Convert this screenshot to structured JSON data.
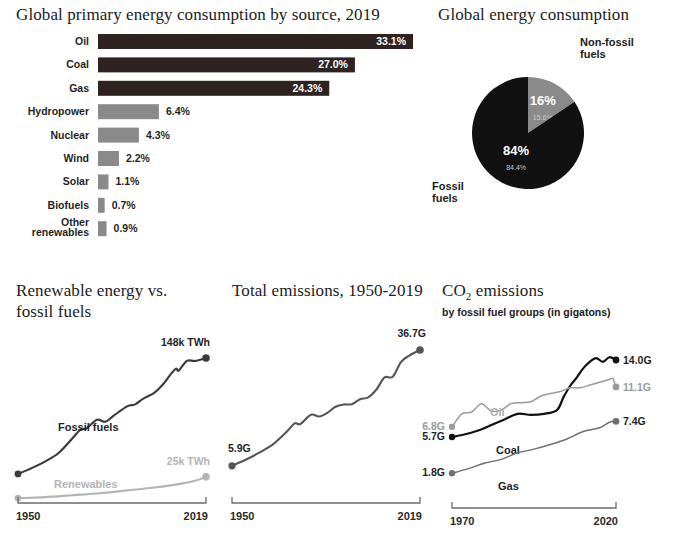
{
  "bar_panel": {
    "title": "Global primary energy consumption by source, 2019"
  },
  "pie_panel": {
    "title": "Global energy consumption",
    "label_nonfossil_line1": "Non-fossil",
    "label_nonfossil_line2": "fuels",
    "label_fossil_line1": "Fossil",
    "label_fossil_line2": "fuels"
  },
  "renew_panel": {
    "title_line1": "Renewable energy vs.",
    "title_line2": "fossil fuels"
  },
  "emis_panel": {
    "title": "Total emissions, 1950-2019"
  },
  "co2_panel": {
    "title_main": "CO",
    "title_sub": "2",
    "title_rest": " emissions",
    "subtitle": "by fossil fuel groups (in gigatons)"
  },
  "colors": {
    "dark": "#2e2320",
    "near_black": "#111111",
    "mid_gray": "#8a8a8a",
    "light_gray": "#b4b4b4",
    "line_dark": "#3a3a3a",
    "axis": "#6b6b6b",
    "white": "#ffffff"
  },
  "chart_data": [
    {
      "id": "energy-by-source",
      "type": "bar",
      "orientation": "horizontal",
      "title": "Global primary energy consumption by source, 2019",
      "xlabel": "",
      "ylabel": "",
      "unit": "%",
      "xlim": [
        0,
        33.1
      ],
      "grid": false,
      "categories": [
        "Oil",
        "Coal",
        "Gas",
        "Hydropower",
        "Nuclear",
        "Wind",
        "Solar",
        "Biofuels",
        "Other renewables"
      ],
      "values": [
        33.1,
        27.0,
        24.3,
        6.4,
        4.3,
        2.2,
        1.1,
        0.7,
        0.9
      ],
      "value_labels": [
        "33.1%",
        "27.0%",
        "24.3%",
        "6.4%",
        "4.3%",
        "2.2%",
        "1.1%",
        "0.7%",
        "0.9%"
      ],
      "label_inside": [
        true,
        true,
        true,
        false,
        false,
        false,
        false,
        false,
        false
      ],
      "bar_colors": [
        "#2e2320",
        "#2e2320",
        "#2e2320",
        "#8a8a8a",
        "#8a8a8a",
        "#8a8a8a",
        "#8a8a8a",
        "#8a8a8a",
        "#8a8a8a"
      ]
    },
    {
      "id": "global-energy-consumption",
      "type": "pie",
      "title": "Global energy consumption",
      "legend_position": "outside",
      "slices": [
        {
          "label": "Non-fossil fuels",
          "value": 15.6,
          "rounded_label": "16%",
          "exact_label": "15.6%",
          "color": "#8a8a8a"
        },
        {
          "label": "Fossil fuels",
          "value": 84.4,
          "rounded_label": "84%",
          "exact_label": "84.4%",
          "color": "#111111"
        }
      ]
    },
    {
      "id": "renewables-vs-fossil",
      "type": "line",
      "title": "Renewable energy vs. fossil fuels",
      "xlabel": "",
      "ylabel": "",
      "unit": "TWh",
      "xlim": [
        1950,
        2019
      ],
      "ylim": [
        0,
        148
      ],
      "x_ticks": [
        "1950",
        "2019"
      ],
      "grid": false,
      "series": [
        {
          "name": "Fossil fuels",
          "color": "#3a3a3a",
          "start_label": "",
          "end_label": "148k TWh",
          "x": [
            1950,
            1955,
            1960,
            1965,
            1970,
            1973,
            1975,
            1979,
            1982,
            1985,
            1990,
            1993,
            1996,
            2000,
            2003,
            2006,
            2008,
            2009,
            2012,
            2015,
            2019
          ],
          "values": [
            28,
            34,
            41,
            50,
            65,
            74,
            75,
            84,
            82,
            88,
            98,
            100,
            106,
            112,
            120,
            131,
            137,
            135,
            145,
            145,
            148
          ]
        },
        {
          "name": "Renewables",
          "color": "#b4b4b4",
          "start_label": "",
          "end_label": "25k TWh",
          "x": [
            1950,
            1960,
            1970,
            1980,
            1990,
            2000,
            2010,
            2015,
            2019
          ],
          "values": [
            3,
            4,
            6,
            8,
            11,
            14,
            18,
            21,
            25
          ]
        }
      ]
    },
    {
      "id": "total-emissions",
      "type": "line",
      "title": "Total emissions, 1950-2019",
      "xlabel": "",
      "ylabel": "",
      "unit": "G",
      "xlim": [
        1950,
        2019
      ],
      "ylim": [
        0,
        36.7
      ],
      "x_ticks": [
        "1950",
        "2019"
      ],
      "grid": false,
      "series": [
        {
          "name": "Total emissions",
          "color": "#555555",
          "start_label": "5.9G",
          "end_label": "36.7G",
          "x": [
            1950,
            1955,
            1960,
            1965,
            1970,
            1973,
            1975,
            1979,
            1982,
            1985,
            1988,
            1991,
            1994,
            1997,
            2000,
            2003,
            2006,
            2009,
            2012,
            2015,
            2019
          ],
          "values": [
            5.9,
            7.5,
            9.4,
            11.6,
            14.9,
            17.2,
            17.0,
            19.5,
            19.0,
            20.0,
            21.6,
            22.2,
            22.3,
            23.6,
            24.1,
            26.2,
            29.4,
            29.6,
            33.5,
            35.2,
            36.7
          ]
        }
      ]
    },
    {
      "id": "co2-by-fossil-group",
      "type": "line",
      "title": "CO2 emissions",
      "subtitle": "by fossil fuel groups (in gigatons)",
      "xlabel": "",
      "ylabel": "",
      "unit": "G",
      "xlim": [
        1970,
        2020
      ],
      "ylim": [
        0,
        14.0
      ],
      "x_ticks": [
        "1970",
        "2020"
      ],
      "grid": false,
      "series": [
        {
          "name": "Coal",
          "color": "#111111",
          "start_label": "5.7G",
          "end_label": "14.0G",
          "x": [
            1970,
            1974,
            1978,
            1982,
            1986,
            1990,
            1994,
            1998,
            2002,
            2004,
            2006,
            2008,
            2010,
            2012,
            2014,
            2016,
            2018,
            2020
          ],
          "values": [
            5.7,
            6.0,
            6.4,
            7.0,
            7.6,
            8.2,
            8.1,
            8.2,
            8.6,
            10.0,
            11.2,
            12.1,
            13.1,
            13.8,
            14.2,
            13.8,
            14.3,
            14.0
          ]
        },
        {
          "name": "Oil",
          "color": "#9a9a9a",
          "start_label": "6.8G",
          "end_label": "11.1G",
          "x": [
            1970,
            1973,
            1976,
            1979,
            1982,
            1985,
            1988,
            1991,
            1994,
            1997,
            2000,
            2003,
            2006,
            2009,
            2012,
            2015,
            2018,
            2019,
            2020
          ],
          "values": [
            6.8,
            8.2,
            8.4,
            9.3,
            8.5,
            8.6,
            9.3,
            9.4,
            9.5,
            10.1,
            10.4,
            10.6,
            11.0,
            11.0,
            11.3,
            11.6,
            11.9,
            12.0,
            11.1
          ]
        },
        {
          "name": "Gas",
          "color": "#6f6f6f",
          "start_label": "1.8G",
          "end_label": "7.4G",
          "x": [
            1970,
            1975,
            1980,
            1985,
            1990,
            1995,
            2000,
            2005,
            2010,
            2015,
            2018,
            2020
          ],
          "values": [
            1.8,
            2.3,
            2.9,
            3.3,
            4.0,
            4.4,
            4.9,
            5.5,
            6.3,
            6.7,
            7.3,
            7.4
          ]
        }
      ]
    }
  ]
}
